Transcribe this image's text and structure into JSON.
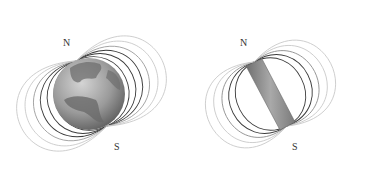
{
  "figure": {
    "panels": [
      {
        "name": "earth",
        "north_label": "N",
        "south_label": "S"
      },
      {
        "name": "bar-magnet",
        "north_label": "N",
        "south_label": "S"
      }
    ],
    "colors": {
      "field_line_dark": "#3a3a3a",
      "field_line_light": "#bdbdbd",
      "earth_ocean": "#a8a8a8",
      "earth_land": "#6e6e6e",
      "magnet": "#8e8e8e"
    }
  }
}
